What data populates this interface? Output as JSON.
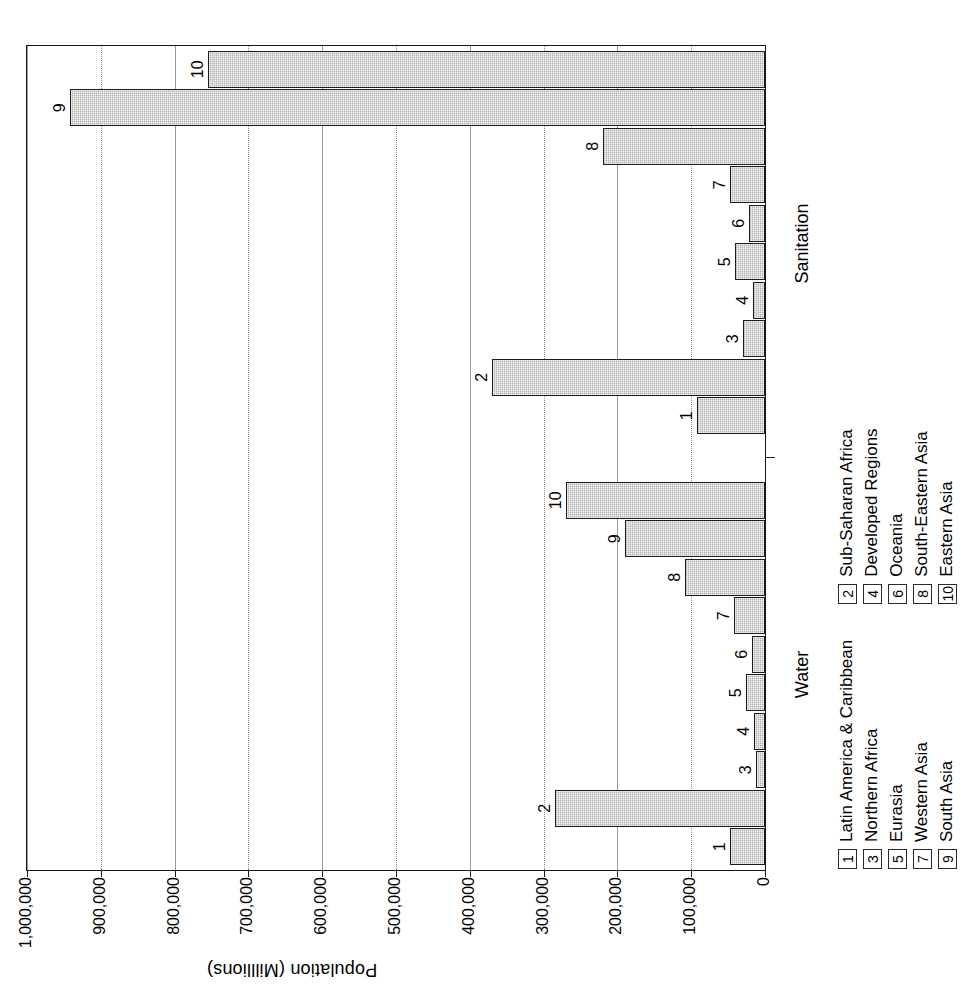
{
  "chart_data": {
    "type": "bar",
    "title": "",
    "xlabel": "",
    "ylabel": "Population (Milllions)",
    "ylim": [
      0,
      1000000
    ],
    "ytick_labels": [
      "0",
      "100,000",
      "200,000",
      "300,000",
      "400,000",
      "500,000",
      "600,000",
      "700,000",
      "800,000",
      "900,000",
      "1,000,000"
    ],
    "ytick_values": [
      0,
      100000,
      200000,
      300000,
      400000,
      500000,
      600000,
      700000,
      800000,
      900000,
      1000000
    ],
    "grid": true,
    "legend_position": "below-axis",
    "groups": [
      {
        "name": "Water",
        "categories": [
          "1",
          "2",
          "3",
          "4",
          "5",
          "6",
          "7",
          "8",
          "9",
          "10"
        ],
        "values": [
          48000,
          284000,
          12000,
          15000,
          26000,
          18000,
          42000,
          108000,
          190000,
          270000
        ]
      },
      {
        "name": "Sanitation",
        "categories": [
          "1",
          "2",
          "3",
          "4",
          "5",
          "6",
          "7",
          "8",
          "9",
          "10"
        ],
        "values": [
          92000,
          370000,
          30000,
          16000,
          40000,
          22000,
          48000,
          220000,
          942000,
          755000
        ]
      }
    ],
    "legend": [
      {
        "key": "1",
        "label": "Latin America & Caribbean"
      },
      {
        "key": "2",
        "label": "Sub-Saharan Africa"
      },
      {
        "key": "3",
        "label": "Northern Africa"
      },
      {
        "key": "4",
        "label": "Developed Regions"
      },
      {
        "key": "5",
        "label": "Eurasia"
      },
      {
        "key": "6",
        "label": "Oceania"
      },
      {
        "key": "7",
        "label": "Western Asia"
      },
      {
        "key": "8",
        "label": "South-Eastern Asia"
      },
      {
        "key": "9",
        "label": "South Asia"
      },
      {
        "key": "10",
        "label": "Eastern Asia"
      }
    ],
    "legend_columns": [
      {
        "keys": [
          "1",
          "3",
          "5",
          "7",
          "9"
        ]
      },
      {
        "keys": [
          "2",
          "4",
          "6",
          "8",
          "10"
        ]
      }
    ],
    "colors": {
      "bar_fill": "#b4b4b4",
      "bar_stroke": "#1c1c1c",
      "axis": "#151515",
      "grid": "#8d8d8d",
      "text": "#000000",
      "background": "#ffffff"
    }
  }
}
